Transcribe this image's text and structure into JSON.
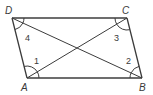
{
  "figure": {
    "type": "parallelogram",
    "vertices": {
      "D": {
        "label": "D",
        "x": 12,
        "y": 18
      },
      "C": {
        "label": "C",
        "x": 127,
        "y": 18
      },
      "A": {
        "label": "A",
        "x": 27,
        "y": 78
      },
      "B": {
        "label": "B",
        "x": 142,
        "y": 78
      }
    },
    "diagonals": [
      "AC",
      "DB"
    ],
    "angles": [
      {
        "label": "1",
        "vertex": "A",
        "between": "AD and AC"
      },
      {
        "label": "2",
        "vertex": "B",
        "between": "BC and BD"
      },
      {
        "label": "3",
        "vertex": "C",
        "between": "CB and CA"
      },
      {
        "label": "4",
        "vertex": "D",
        "between": "DA and DB"
      }
    ],
    "line_color": "#3c3c3c"
  }
}
